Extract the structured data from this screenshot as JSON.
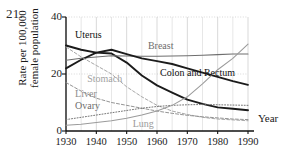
{
  "figure": {
    "problem_number": "21.",
    "year_axis_caption": "Year"
  },
  "chart_data": {
    "type": "line",
    "title": "",
    "xlabel": "Year",
    "ylabel": "Rate per 100,000 female population",
    "ylabel_line1": "Rate per 100,000",
    "ylabel_line2": "female population",
    "xlim": [
      1930,
      1990
    ],
    "ylim": [
      0,
      40
    ],
    "yticks": [
      0,
      20,
      40
    ],
    "ytick_labels": [
      "0",
      "20",
      "40"
    ],
    "xticks": [
      1930,
      1940,
      1950,
      1960,
      1970,
      1980,
      1990
    ],
    "xtick_labels": [
      "1930",
      "1940",
      "1950",
      "1960",
      "1970",
      "1980",
      "1990"
    ],
    "grid": true,
    "grid_minor_x_step": 5,
    "legend_position": "inline-annotations",
    "x": [
      1930,
      1935,
      1940,
      1945,
      1950,
      1955,
      1960,
      1965,
      1970,
      1975,
      1980,
      1985,
      1990
    ],
    "series": [
      {
        "name": "Uterus",
        "label": "Uterus",
        "style": "solid-thick",
        "color": "#1b1b1b",
        "label_x": 1933,
        "label_y": 33.5,
        "values": [
          30.0,
          28.5,
          27.5,
          27.2,
          24.0,
          19.5,
          16.0,
          13.5,
          11.0,
          9.5,
          8.3,
          7.8,
          7.3
        ]
      },
      {
        "name": "Breast",
        "label": "Breast",
        "style": "solid-thin",
        "color": "#6e6e6e",
        "label_x": 1957,
        "label_y": 29.5,
        "values": [
          24.8,
          25.5,
          26.0,
          26.4,
          26.3,
          26.2,
          26.2,
          26.3,
          26.4,
          26.6,
          26.8,
          27.0,
          27.0
        ]
      },
      {
        "name": "Colon and Rectum",
        "label": "Colon and Rectum",
        "style": "solid-thick",
        "color": "#1b1b1b",
        "label_x": 1961,
        "label_y": 20.0,
        "values": [
          22.0,
          25.0,
          27.5,
          28.5,
          27.0,
          25.5,
          24.5,
          23.5,
          22.0,
          20.5,
          19.0,
          17.5,
          16.2
        ]
      },
      {
        "name": "Stomach",
        "label": "Stomach",
        "style": "dashed",
        "color": "#a2a2a2",
        "label_x": 1937,
        "label_y": 18.0,
        "values": [
          29.5,
          26.0,
          23.0,
          20.0,
          15.5,
          12.0,
          9.0,
          7.0,
          5.8,
          4.8,
          4.2,
          3.9,
          3.6
        ]
      },
      {
        "name": "Liver",
        "label": "Liver",
        "style": "dashed",
        "color": "#8e8e8e",
        "label_x": 1933,
        "label_y": 12.5,
        "values": [
          17.0,
          14.0,
          11.5,
          10.0,
          9.0,
          8.0,
          7.0,
          6.2,
          5.5,
          5.0,
          4.6,
          4.2,
          4.0
        ]
      },
      {
        "name": "Ovary",
        "label": "Ovary",
        "style": "dotted",
        "color": "#6e6e6e",
        "label_x": 1933,
        "label_y": 8.5,
        "values": [
          4.0,
          4.8,
          5.6,
          6.4,
          7.2,
          8.0,
          8.6,
          9.0,
          9.2,
          9.3,
          9.2,
          9.1,
          9.0
        ]
      },
      {
        "name": "Lung",
        "label": "Lung",
        "style": "solid-thin",
        "color": "#9b9b9b",
        "label_x": 1952,
        "label_y": 2.2,
        "values": [
          2.0,
          2.4,
          3.0,
          3.6,
          4.5,
          5.6,
          7.0,
          9.0,
          12.0,
          16.5,
          21.5,
          25.5,
          30.5
        ]
      }
    ]
  }
}
